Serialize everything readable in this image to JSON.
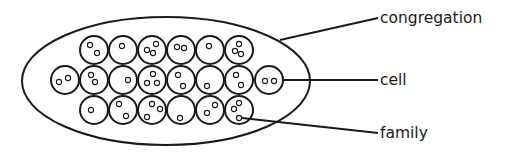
{
  "labels": {
    "congregation": "congregation",
    "cell": "cell",
    "family": "family"
  },
  "colors": {
    "stroke": "#1a1a1a",
    "background": "#ffffff"
  },
  "congregation": {
    "cx": 166,
    "cy": 81,
    "rx": 144,
    "ry": 64
  },
  "cell_radius": 14,
  "family_radius": 2.6,
  "cells": [
    {
      "x": 94,
      "y": 50,
      "families": [
        [
          -4,
          -5
        ],
        [
          3,
          3
        ]
      ]
    },
    {
      "x": 123,
      "y": 50,
      "families": [
        [
          -1,
          -4
        ]
      ]
    },
    {
      "x": 152,
      "y": 50,
      "families": [
        [
          -5,
          0
        ],
        [
          4,
          -6
        ],
        [
          1,
          3
        ]
      ]
    },
    {
      "x": 181,
      "y": 50,
      "families": [
        [
          -4,
          -3
        ],
        [
          3,
          -2
        ]
      ]
    },
    {
      "x": 210,
      "y": 50,
      "families": [
        [
          -1,
          -4
        ]
      ]
    },
    {
      "x": 239,
      "y": 50,
      "families": [
        [
          0,
          -6
        ],
        [
          -4,
          1
        ],
        [
          2,
          4
        ]
      ]
    },
    {
      "x": 65,
      "y": 80,
      "families": [
        [
          -6,
          2
        ],
        [
          3,
          -2
        ]
      ]
    },
    {
      "x": 94,
      "y": 80,
      "families": [
        [
          -3,
          -5
        ],
        [
          1,
          2
        ]
      ]
    },
    {
      "x": 123,
      "y": 80,
      "families": [
        [
          5,
          0
        ]
      ]
    },
    {
      "x": 152,
      "y": 80,
      "families": [
        [
          1,
          -6
        ],
        [
          -5,
          3
        ],
        [
          5,
          3
        ]
      ]
    },
    {
      "x": 181,
      "y": 80,
      "families": [
        [
          -3,
          -5
        ],
        [
          2,
          6
        ]
      ]
    },
    {
      "x": 210,
      "y": 80,
      "families": [
        [
          -3,
          6
        ]
      ]
    },
    {
      "x": 239,
      "y": 80,
      "families": [
        [
          -3,
          -5
        ],
        [
          2,
          5
        ]
      ]
    },
    {
      "x": 269,
      "y": 80,
      "families": [
        [
          -4,
          1
        ],
        [
          5,
          1
        ]
      ]
    },
    {
      "x": 94,
      "y": 110,
      "families": [
        [
          -3,
          0
        ]
      ]
    },
    {
      "x": 123,
      "y": 110,
      "families": [
        [
          -4,
          -6
        ],
        [
          3,
          6
        ]
      ]
    },
    {
      "x": 152,
      "y": 110,
      "families": [
        [
          0,
          -6
        ],
        [
          8,
          -1
        ],
        [
          -5,
          7
        ]
      ]
    },
    {
      "x": 181,
      "y": 110,
      "families": [
        [
          -1,
          8
        ]
      ]
    },
    {
      "x": 210,
      "y": 110,
      "families": [
        [
          5,
          -5
        ],
        [
          -3,
          3
        ]
      ]
    },
    {
      "x": 239,
      "y": 110,
      "families": [
        [
          0,
          -7
        ],
        [
          -5,
          -1
        ],
        [
          0,
          8
        ]
      ]
    }
  ],
  "leaders": {
    "congregation": {
      "x1": 280,
      "y1": 40,
      "x2": 378,
      "y2": 18
    },
    "cell": {
      "x1": 283,
      "y1": 80,
      "x2": 378,
      "y2": 80
    },
    "family": {
      "x1": 242,
      "y1": 118,
      "x2": 378,
      "y2": 133
    }
  },
  "label_positions": {
    "congregation": {
      "x": 380,
      "y": 23
    },
    "cell": {
      "x": 380,
      "y": 85
    },
    "family": {
      "x": 380,
      "y": 138
    }
  }
}
